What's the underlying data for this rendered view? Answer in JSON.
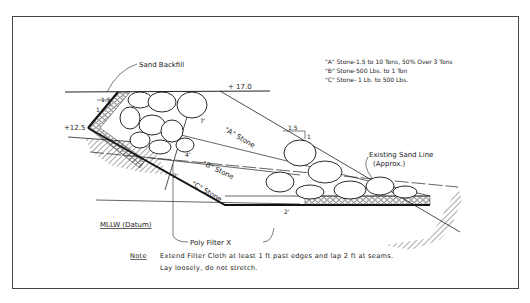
{
  "diagram": {
    "type": "revetment-cross-section",
    "legend": [
      "\"A\" Stone-1.5 to 10 Tons, 50% Over 3 Tons",
      "\"B\" Stone-500 Lbs. to 1 Ton",
      "\"C\" Stone- 1 Lb. to 500 Lbs."
    ],
    "labels": {
      "sand_backfill": "Sand Backfill",
      "elev_top": "+ 17.0",
      "elev_toe": "+12.5",
      "slope_left_h": "1.5",
      "slope_left_v": "1",
      "slope_right_h": "1.5",
      "slope_right_v": "1",
      "stone_a": "\"A\" Stone",
      "stone_b": "\"B\" Stone",
      "stone_c": "\"C\" Stone",
      "thick_a": "7'",
      "thick_a2": "4'",
      "thick_c": "2'",
      "thick_toe": "2'",
      "existing_sand_line": "Existing Sand Line",
      "existing_sand_line_approx": "(Approx.)",
      "datum": "MLLW (Datum)",
      "filter": "Poly Filter X"
    },
    "note": {
      "heading": "Note",
      "line1": "Extend Filter Cloth at least 1 ft past edges and lap 2 ft at seams.",
      "line2": "Lay loosely, do not stretch."
    }
  }
}
